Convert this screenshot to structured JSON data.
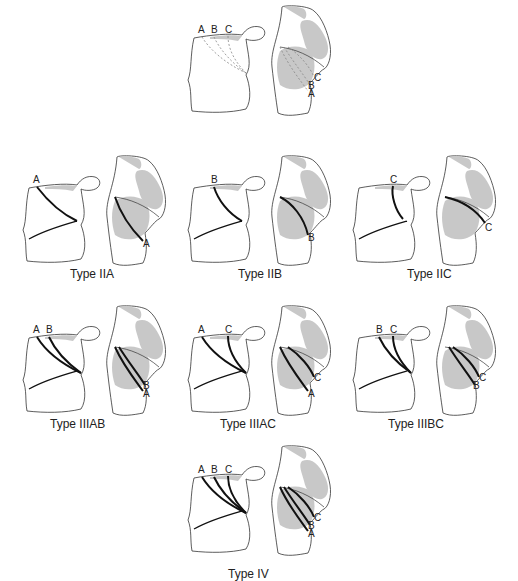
{
  "figure": {
    "panels": [
      {
        "id": "reference",
        "caption": "",
        "lines": [
          "A",
          "B",
          "C"
        ],
        "style": "dashed",
        "labels_left": [
          "A",
          "B",
          "C"
        ],
        "labels_right": [
          "C",
          "B",
          "A"
        ]
      },
      {
        "id": "IIA",
        "caption": "Type IIA",
        "lines": [
          "A"
        ],
        "labels_left": [
          "A"
        ],
        "labels_right": [
          "A"
        ]
      },
      {
        "id": "IIB",
        "caption": "Type IIB",
        "lines": [
          "B"
        ],
        "labels_left": [
          "B"
        ],
        "labels_right": [
          "B"
        ]
      },
      {
        "id": "IIC",
        "caption": "Type IIC",
        "lines": [
          "C"
        ],
        "labels_left": [
          "C"
        ],
        "labels_right": [
          "C"
        ]
      },
      {
        "id": "IIIAB",
        "caption": "Type IIIAB",
        "lines": [
          "A",
          "B"
        ],
        "labels_left": [
          "A",
          "B"
        ],
        "labels_right": [
          "B",
          "A"
        ]
      },
      {
        "id": "IIIAC",
        "caption": "Type IIIAC",
        "lines": [
          "A",
          "C"
        ],
        "labels_left": [
          "A",
          "C"
        ],
        "labels_right": [
          "C",
          "A"
        ]
      },
      {
        "id": "IIIBC",
        "caption": "Type IIIBC",
        "lines": [
          "B",
          "C"
        ],
        "labels_left": [
          "B",
          "C"
        ],
        "labels_right": [
          "C",
          "B"
        ]
      },
      {
        "id": "IV",
        "caption": "Type IV",
        "lines": [
          "A",
          "B",
          "C"
        ],
        "labels_left": [
          "A",
          "B",
          "C"
        ],
        "labels_right": [
          "C",
          "B",
          "A"
        ]
      }
    ],
    "colors": {
      "outline": "#333333",
      "shade": "#c8c8c8",
      "fracture": "#111111",
      "dashed": "#888888"
    }
  }
}
